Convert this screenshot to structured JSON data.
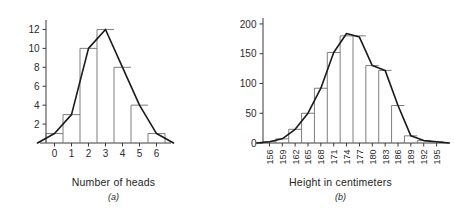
{
  "figure": {
    "panel_a_caption": "Number of heads",
    "panel_a_label": "(a)",
    "panel_b_caption": "Height in centimeters",
    "panel_b_label": "(b)"
  },
  "colors": {
    "background": "#ffffff",
    "axis": "#3a3a3a",
    "bar_outline": "#6f6f6f",
    "polygon_line": "#1a1a1a",
    "text": "#2b2b2b"
  },
  "chart_data": [
    {
      "type": "bar",
      "id": "panel-a",
      "title": "",
      "xlabel": "Number of heads",
      "ylabel": "",
      "panel_label": "(a)",
      "categories": [
        "0",
        "1",
        "2",
        "3",
        "4",
        "5",
        "6"
      ],
      "values": [
        1,
        3,
        10,
        12,
        8,
        4,
        1
      ],
      "x_tick_labels": [
        "0",
        "1",
        "2",
        "3",
        "4",
        "5",
        "6"
      ],
      "y_tick_labels": [
        "2",
        "4",
        "6",
        "8",
        "10",
        "12"
      ],
      "y_tick_values": [
        2,
        4,
        6,
        8,
        10,
        12
      ],
      "xlim": [
        -0.5,
        6.5
      ],
      "ylim": [
        0,
        13
      ],
      "grid": false,
      "legend": null,
      "overlay": {
        "type": "line",
        "name": "frequency polygon",
        "x": [
          -1,
          0,
          1,
          2,
          3,
          4,
          5,
          6,
          7
        ],
        "y": [
          0,
          1,
          3,
          10,
          12,
          8,
          4,
          1,
          0
        ]
      }
    },
    {
      "type": "bar",
      "id": "panel-b",
      "title": "",
      "xlabel": "Height in centimeters",
      "ylabel": "",
      "panel_label": "(b)",
      "categories": [
        "156",
        "159",
        "162",
        "165",
        "168",
        "171",
        "174",
        "177",
        "180",
        "183",
        "186",
        "189",
        "192",
        "195"
      ],
      "values": [
        2,
        7,
        23,
        50,
        92,
        152,
        180,
        180,
        130,
        122,
        63,
        12,
        4,
        2
      ],
      "x_tick_labels": [
        "156",
        "159",
        "162",
        "165",
        "168",
        "171",
        "174",
        "177",
        "180",
        "183",
        "186",
        "189",
        "192",
        "195"
      ],
      "y_tick_labels": [
        "0",
        "50",
        "100",
        "150",
        "200"
      ],
      "y_tick_values": [
        0,
        50,
        100,
        150,
        200
      ],
      "xlim": [
        -0.5,
        13.5
      ],
      "ylim": [
        0,
        210
      ],
      "grid": false,
      "legend": null,
      "overlay": {
        "type": "line",
        "name": "frequency polygon",
        "x": [
          -1,
          0,
          1,
          2,
          3,
          4,
          5,
          6,
          7,
          8,
          9,
          10,
          11,
          12,
          13,
          14
        ],
        "y": [
          0,
          2,
          7,
          23,
          50,
          92,
          152,
          184,
          178,
          130,
          122,
          63,
          12,
          4,
          2,
          0
        ]
      }
    }
  ]
}
